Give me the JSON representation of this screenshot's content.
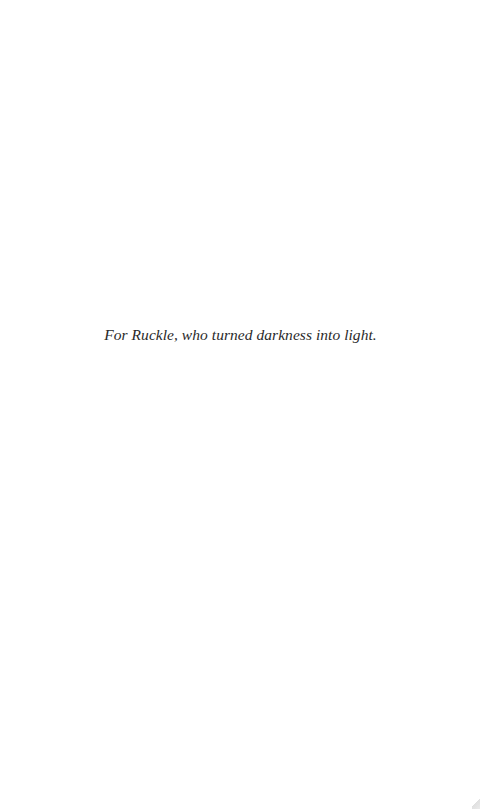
{
  "page": {
    "type": "dedication",
    "dedication_text": "For Ruckle, who turned darkness into light."
  }
}
